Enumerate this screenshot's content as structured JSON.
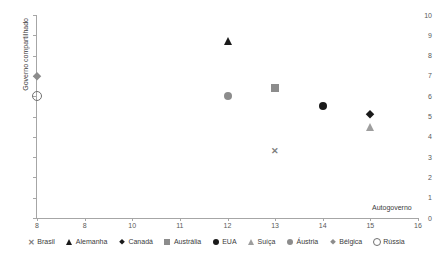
{
  "chart_data": {
    "type": "scatter",
    "title": "",
    "xlabel": "Autogoverno",
    "ylabel": "Governo compartilhado",
    "xlim": [
      8,
      16
    ],
    "ylim": [
      0,
      10
    ],
    "grid": false,
    "legend_position": "bottom",
    "xticks": [
      "8",
      "8",
      "10",
      "11",
      "12",
      "13",
      "14",
      "15",
      "16"
    ],
    "yticks": [
      "0",
      "1",
      "2",
      "3",
      "4",
      "5",
      "6",
      "7",
      "8",
      "9",
      "10"
    ],
    "points": [
      {
        "name": "Brasil",
        "x": 13,
        "y": 3.3,
        "marker": "x",
        "color": "#7f7f7f"
      },
      {
        "name": "Alemanha",
        "x": 12,
        "y": 8.7,
        "marker": "triangle",
        "color": "#1a1a1a"
      },
      {
        "name": "Canadá",
        "x": 15,
        "y": 5.1,
        "marker": "diamond",
        "color": "#1a1a1a"
      },
      {
        "name": "Austrália",
        "x": 13,
        "y": 6.4,
        "marker": "square",
        "color": "#8c8c8c"
      },
      {
        "name": "EUA",
        "x": 14,
        "y": 5.5,
        "marker": "circle",
        "color": "#1a1a1a"
      },
      {
        "name": "Suíça",
        "x": 15,
        "y": 4.5,
        "marker": "triangle",
        "color": "#9e9e9e"
      },
      {
        "name": "Áustria",
        "x": 12,
        "y": 6.0,
        "marker": "circle",
        "color": "#8c8c8c"
      },
      {
        "name": "Bélgica",
        "x": 8,
        "y": 7.0,
        "marker": "diamond",
        "color": "#8c8c8c"
      },
      {
        "name": "Rússia",
        "x": 8,
        "y": 6.0,
        "marker": "open-circle",
        "color": "#707070"
      }
    ],
    "legend": [
      {
        "label": "Brasil",
        "marker": "x",
        "color": "#7f7f7f"
      },
      {
        "label": "Alemanha",
        "marker": "triangle",
        "color": "#1a1a1a"
      },
      {
        "label": "Canadá",
        "marker": "diamond",
        "color": "#1a1a1a"
      },
      {
        "label": "Austrália",
        "marker": "square",
        "color": "#8c8c8c"
      },
      {
        "label": "EUA",
        "marker": "circle",
        "color": "#1a1a1a"
      },
      {
        "label": "Suíça",
        "marker": "triangle",
        "color": "#9e9e9e"
      },
      {
        "label": "Áustria",
        "marker": "circle",
        "color": "#8c8c8c"
      },
      {
        "label": "Bélgica",
        "marker": "diamond",
        "color": "#8c8c8c"
      },
      {
        "label": "Rússia",
        "marker": "open-circle",
        "color": "#707070"
      }
    ],
    "axis_color": "#a6a6a6",
    "tick_text_color": "#595959"
  }
}
